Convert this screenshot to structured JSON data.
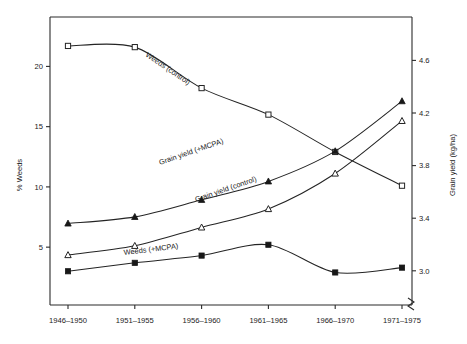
{
  "chart_data": {
    "type": "line",
    "title": "",
    "subtitle": "",
    "categories": [
      "1946–1950",
      "1951–1955",
      "1956–1960",
      "1961–1965",
      "1966–1970",
      "1971–1975"
    ],
    "xlabel": "",
    "left_axis": {
      "label": "% Weeds",
      "ticks": [
        5,
        10,
        15,
        20
      ],
      "ticklabels": [
        "5",
        "10",
        "15",
        "20"
      ],
      "range": [
        0.2,
        24.1
      ]
    },
    "right_axis": {
      "label": "Grain yield (kg/ha)",
      "ticks": [
        3.0,
        3.4,
        3.8,
        4.2,
        4.6
      ],
      "ticklabels": [
        "3.0",
        "3.4",
        "3.8",
        "4.2",
        "4.6"
      ],
      "range": [
        2.74,
        4.93
      ],
      "axis_break": true
    },
    "grid": false,
    "legend_position": "inline-annotations",
    "series": [
      {
        "name": "Weeds (control)",
        "axis": "left",
        "marker": "open-square",
        "values": [
          21.7,
          21.6,
          18.2,
          16.0,
          12.9,
          10.1
        ],
        "label": "Weeds (control)"
      },
      {
        "name": "Weeds (+MCPA)",
        "axis": "left",
        "marker": "filled-square",
        "values": [
          3.0,
          3.7,
          4.3,
          5.2,
          2.9,
          3.3
        ],
        "label": "Weeds (+MCPA)"
      },
      {
        "name": "Grain yield (+MCPA)",
        "axis": "right",
        "marker": "filled-triangle",
        "values": [
          3.36,
          3.41,
          3.54,
          3.68,
          3.91,
          4.29
        ],
        "label": "Grain yield (+MCPA)"
      },
      {
        "name": "Grain yield (control)",
        "axis": "right",
        "marker": "open-triangle",
        "values": [
          3.12,
          3.19,
          3.33,
          3.47,
          3.74,
          4.14
        ],
        "label": "Grain yield (control)"
      }
    ],
    "annotations": [
      {
        "text": "Weeds (control)",
        "x": 145,
        "y": 56,
        "rotate": 34
      },
      {
        "text": "Grain yield (+MCPA)",
        "x": 160,
        "y": 165,
        "rotate": -19
      },
      {
        "text": "Grain yield (control)",
        "x": 196,
        "y": 202,
        "rotate": -19
      },
      {
        "text": "Weeds (+MCPA)",
        "x": 124,
        "y": 255,
        "rotate": -7
      }
    ]
  }
}
